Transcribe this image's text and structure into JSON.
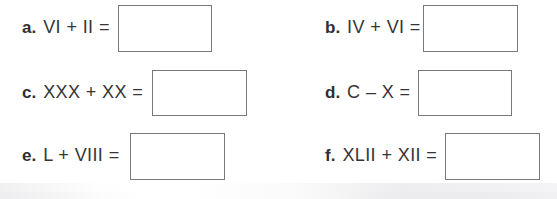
{
  "worksheet": {
    "type": "roman-numeral-arithmetic-exercise",
    "background_color": "#ffffff",
    "text_color": "#34343a",
    "box_border_color": "#77777d",
    "problems": [
      {
        "id": "a",
        "letter": "a.",
        "expression": "VI + II =",
        "answer": "",
        "column": "left",
        "row": 1
      },
      {
        "id": "b",
        "letter": "b.",
        "expression": "IV + VI =",
        "answer": "",
        "column": "right",
        "row": 1
      },
      {
        "id": "c",
        "letter": "c.",
        "expression": "XXX + XX =",
        "answer": "",
        "column": "left",
        "row": 2
      },
      {
        "id": "d",
        "letter": "d.",
        "expression": "C – X =",
        "answer": "",
        "column": "right",
        "row": 2
      },
      {
        "id": "e",
        "letter": "e.",
        "expression": "L + VIII =",
        "answer": "",
        "column": "left",
        "row": 3
      },
      {
        "id": "f",
        "letter": "f.",
        "expression": "XLII + XII =",
        "answer": "",
        "column": "right",
        "row": 3
      }
    ]
  }
}
